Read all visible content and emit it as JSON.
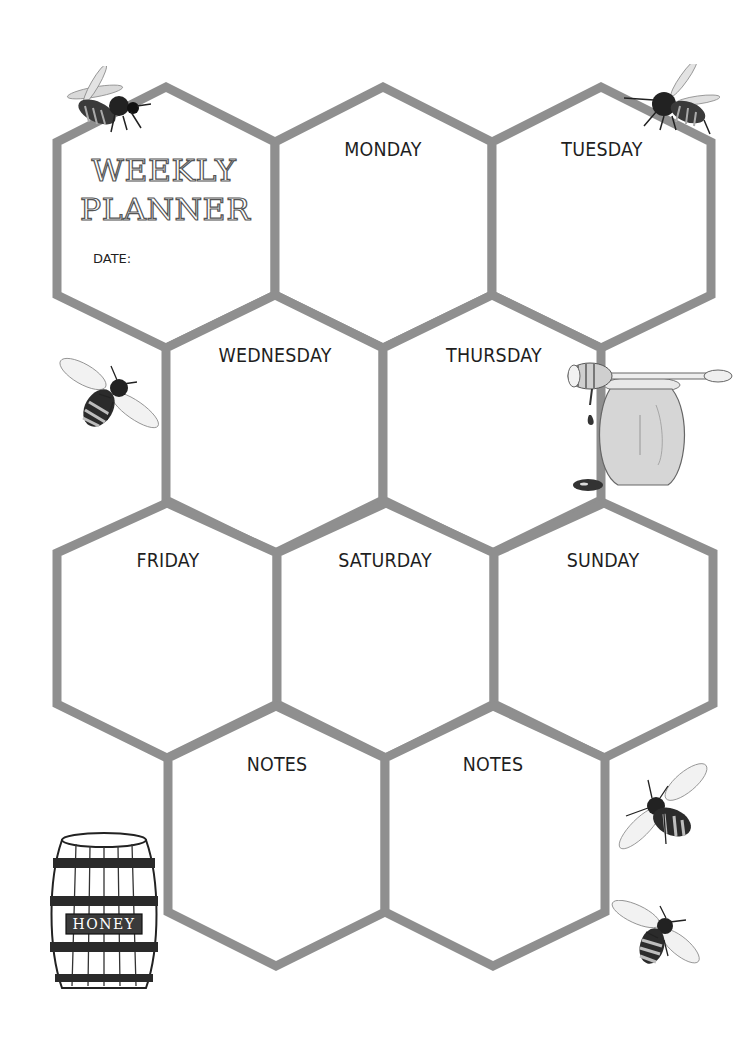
{
  "title": {
    "line1": "WEEKLY",
    "line2": "PLANNER",
    "date_label": "DATE:"
  },
  "cells": [
    {
      "id": "monday",
      "label": "MONDAY"
    },
    {
      "id": "tuesday",
      "label": "TUESDAY"
    },
    {
      "id": "wednesday",
      "label": "WEDNESDAY"
    },
    {
      "id": "thursday",
      "label": "THURSDAY"
    },
    {
      "id": "friday",
      "label": "FRIDAY"
    },
    {
      "id": "saturday",
      "label": "SATURDAY"
    },
    {
      "id": "sunday",
      "label": "SUNDAY"
    },
    {
      "id": "notes1",
      "label": "NOTES"
    },
    {
      "id": "notes2",
      "label": "NOTES"
    }
  ],
  "decorations": {
    "barrel_label": "HONEY",
    "icons": [
      "bee-icon",
      "honey-jar-icon",
      "honey-dipper-icon",
      "honey-barrel-icon"
    ]
  },
  "colors": {
    "hex_stroke": "#8f8f8f",
    "text": "#1f1f1f",
    "background": "#ffffff"
  }
}
